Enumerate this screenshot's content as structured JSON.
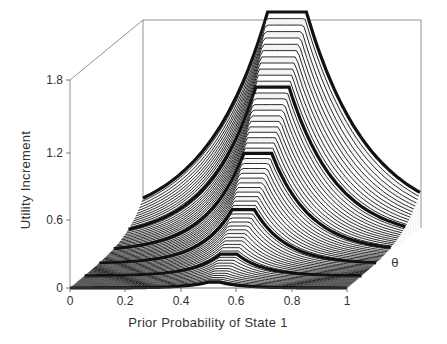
{
  "chart_data": {
    "type": "surface3d",
    "title": "",
    "xlabel": "Prior Probability of State 1",
    "ylabel": "Utility Increment",
    "zlabel": "θ",
    "x_ticks": [
      "0",
      "0.2",
      "0.4",
      "0.6",
      "0.8",
      "1"
    ],
    "y_ticks": [
      "0",
      "0.6",
      "1.2",
      "1.8"
    ],
    "xlim": [
      0,
      1
    ],
    "ylim": [
      0,
      1.8
    ],
    "grid": false,
    "legend": null,
    "slices": [
      {
        "theta_index": 0,
        "peak_x": 0.52,
        "peak_y": 0.08
      },
      {
        "theta_index": 1,
        "peak_x": 0.52,
        "peak_y": 0.25
      },
      {
        "theta_index": 2,
        "peak_x": 0.52,
        "peak_y": 0.55
      },
      {
        "theta_index": 3,
        "peak_x": 0.52,
        "peak_y": 1.0
      },
      {
        "theta_index": 4,
        "peak_x": 0.52,
        "peak_y": 1.4
      },
      {
        "theta_index": 5,
        "peak_x": 0.52,
        "peak_y": 1.85
      }
    ]
  },
  "axes": {
    "x_title": "Prior Probability of State 1",
    "y_title": "Utility Increment",
    "depth_title": "θ"
  }
}
